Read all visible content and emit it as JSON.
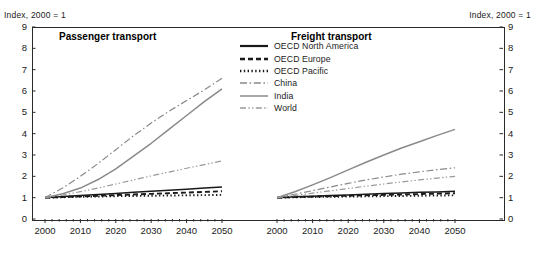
{
  "index_label_left": "Index, 2000 = 1",
  "index_label_right": "Index, 2000 = 1",
  "panels": {
    "left_title": "Passenger transport",
    "right_title": "Freight transport"
  },
  "legend": {
    "items": [
      {
        "label": "OECD North America",
        "style": "solid",
        "color": "#1a1a1a"
      },
      {
        "label": "OECD Europe",
        "style": "dashed",
        "color": "#1a1a1a"
      },
      {
        "label": "OECD Pacific",
        "style": "dotted",
        "color": "#1a1a1a"
      },
      {
        "label": "China",
        "style": "dashdot",
        "color": "#8a8a8a"
      },
      {
        "label": "India",
        "style": "solid",
        "color": "#8a8a8a"
      },
      {
        "label": "World",
        "style": "dashdotdot",
        "color": "#9a9a9a"
      }
    ]
  },
  "yticks": [
    0,
    1,
    2,
    3,
    4,
    5,
    6,
    7,
    8,
    9
  ],
  "xticks": [
    2000,
    2010,
    2020,
    2030,
    2040,
    2050
  ],
  "chart_data": {
    "type": "line",
    "title": "",
    "xlabel": "",
    "ylabel": "Index, 2000 = 1",
    "xlim": [
      2000,
      2050
    ],
    "ylim": [
      0,
      9
    ],
    "grid": false,
    "legend_position": "center-top",
    "panels": [
      {
        "name": "Passenger transport",
        "x": [
          2000,
          2005,
          2010,
          2015,
          2020,
          2025,
          2030,
          2035,
          2040,
          2045,
          2050
        ],
        "series": [
          {
            "name": "OECD North America",
            "style": "solid",
            "color": "#1a1a1a",
            "values": [
              1.0,
              1.05,
              1.1,
              1.15,
              1.2,
              1.25,
              1.3,
              1.35,
              1.4,
              1.45,
              1.5
            ]
          },
          {
            "name": "OECD Europe",
            "style": "dashed",
            "color": "#1a1a1a",
            "values": [
              1.0,
              1.03,
              1.06,
              1.09,
              1.12,
              1.15,
              1.18,
              1.21,
              1.24,
              1.27,
              1.3
            ]
          },
          {
            "name": "OECD Pacific",
            "style": "dotted",
            "color": "#1a1a1a",
            "values": [
              1.0,
              1.02,
              1.04,
              1.05,
              1.07,
              1.08,
              1.09,
              1.1,
              1.11,
              1.12,
              1.13
            ]
          },
          {
            "name": "China",
            "style": "dashdot",
            "color": "#8a8a8a",
            "values": [
              1.0,
              1.45,
              2.0,
              2.6,
              3.25,
              3.9,
              4.5,
              5.05,
              5.55,
              6.05,
              6.6
            ]
          },
          {
            "name": "India",
            "style": "solid",
            "color": "#8a8a8a",
            "values": [
              1.0,
              1.18,
              1.45,
              1.85,
              2.35,
              2.95,
              3.55,
              4.2,
              4.85,
              5.5,
              6.1
            ]
          },
          {
            "name": "World",
            "style": "dashdotdot",
            "color": "#9a9a9a",
            "values": [
              1.0,
              1.12,
              1.28,
              1.45,
              1.64,
              1.83,
              2.02,
              2.2,
              2.38,
              2.55,
              2.72
            ]
          }
        ]
      },
      {
        "name": "Freight transport",
        "x": [
          2000,
          2005,
          2010,
          2015,
          2020,
          2025,
          2030,
          2035,
          2040,
          2045,
          2050
        ],
        "series": [
          {
            "name": "OECD North America",
            "style": "solid",
            "color": "#1a1a1a",
            "values": [
              1.0,
              1.04,
              1.07,
              1.1,
              1.13,
              1.16,
              1.19,
              1.22,
              1.25,
              1.27,
              1.3
            ]
          },
          {
            "name": "OECD Europe",
            "style": "dashed",
            "color": "#1a1a1a",
            "values": [
              1.0,
              1.03,
              1.05,
              1.07,
              1.09,
              1.11,
              1.13,
              1.15,
              1.17,
              1.19,
              1.21
            ]
          },
          {
            "name": "OECD Pacific",
            "style": "dotted",
            "color": "#1a1a1a",
            "values": [
              1.0,
              1.02,
              1.03,
              1.04,
              1.05,
              1.06,
              1.07,
              1.08,
              1.09,
              1.1,
              1.11
            ]
          },
          {
            "name": "China",
            "style": "dashdot",
            "color": "#8a8a8a",
            "values": [
              1.0,
              1.16,
              1.33,
              1.5,
              1.67,
              1.83,
              1.97,
              2.1,
              2.21,
              2.31,
              2.4
            ]
          },
          {
            "name": "India",
            "style": "solid",
            "color": "#8a8a8a",
            "values": [
              1.0,
              1.28,
              1.6,
              1.94,
              2.3,
              2.66,
              3.0,
              3.33,
              3.62,
              3.92,
              4.2
            ]
          },
          {
            "name": "World",
            "style": "dashdotdot",
            "color": "#9a9a9a",
            "values": [
              1.0,
              1.1,
              1.21,
              1.32,
              1.43,
              1.54,
              1.64,
              1.74,
              1.83,
              1.92,
              2.0
            ]
          }
        ]
      }
    ]
  }
}
